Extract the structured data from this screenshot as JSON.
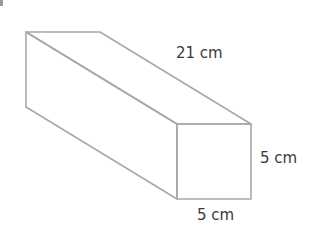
{
  "figure": {
    "type": "rectangular-prism",
    "stroke_color": "#a8a8a8",
    "text_color": "#3a3a3a",
    "vertices": {
      "back_top_left": [
        26,
        32
      ],
      "back_top_right": [
        100,
        32
      ],
      "back_bottom_left": [
        26,
        107
      ],
      "front_top_left": [
        177,
        124
      ],
      "front_top_right": [
        251,
        124
      ],
      "front_bottom_left": [
        177,
        199
      ],
      "front_bottom_right": [
        251,
        199
      ]
    },
    "labels": {
      "length": "21 cm",
      "height": "5 cm",
      "width": "5 cm"
    }
  }
}
